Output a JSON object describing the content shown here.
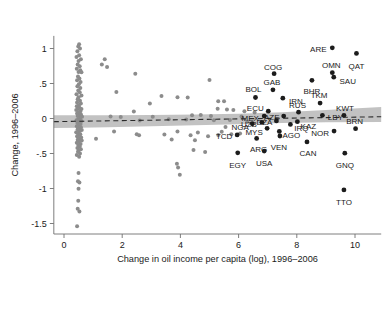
{
  "chart_data": {
    "type": "scatter",
    "title": "",
    "subtitle": "",
    "xlabel": "Change in oil income per capita (log), 1996–2006",
    "ylabel": "Change, 1996–2006",
    "xlim": [
      -0.35,
      10.9
    ],
    "ylim": [
      -1.65,
      1.18
    ],
    "xticks": [
      0,
      2,
      4,
      6,
      8,
      10
    ],
    "xticklabels": [
      "0",
      "2",
      "4",
      "6",
      "8",
      "10"
    ],
    "yticks": [
      1,
      0.5,
      0,
      -0.5,
      -1,
      -1.5
    ],
    "yticklabels": [
      "1",
      ".5",
      "0",
      "-.5",
      "-1",
      "-1.5"
    ],
    "grid": false,
    "legend": null,
    "legend_position": "none",
    "marker_color_background": "#8c8c8c",
    "marker_color_labeled": "#1c1c1c",
    "fit_line_color": "#2a2a2a",
    "fit_line_style": "dashed",
    "ci_band_color": "#bdbdbd",
    "annotations_note": "Labeled points are ISO3 country codes for oil producers",
    "fit_line": {
      "name": "linear fit",
      "x": [
        -0.35,
        10.9
      ],
      "y": [
        -0.045,
        0.025
      ]
    },
    "ci_band": {
      "name": "confidence interval",
      "x": [
        -0.35,
        0.5,
        1.5,
        3.0,
        4.5,
        6.0,
        7.5,
        9.0,
        10.9
      ],
      "y_upper": [
        0.045,
        0.045,
        0.046,
        0.05,
        0.057,
        0.068,
        0.088,
        0.12,
        0.165
      ],
      "y_lower": [
        -0.135,
        -0.132,
        -0.125,
        -0.112,
        -0.098,
        -0.082,
        -0.065,
        -0.055,
        -0.05
      ]
    },
    "series": [
      {
        "name": "Labeled oil producers",
        "marker": "filled-circle-dark",
        "points": [
          {
            "label": "ARE",
            "x": 9.22,
            "y": 1.01,
            "label_dx": -14,
            "label_dy": 1
          },
          {
            "label": "QAT",
            "x": 10.05,
            "y": 0.93,
            "label_dx": 0,
            "label_dy": 13
          },
          {
            "label": "COG",
            "x": 7.22,
            "y": 0.64,
            "label_dx": -1,
            "label_dy": -7
          },
          {
            "label": "OMN",
            "x": 9.22,
            "y": 0.655,
            "label_dx": -1,
            "label_dy": -7
          },
          {
            "label": "SAU",
            "x": 9.27,
            "y": 0.59,
            "label_dx": 14,
            "label_dy": 4
          },
          {
            "label": "BHR",
            "x": 8.52,
            "y": 0.545,
            "label_dx": 0,
            "label_dy": 11
          },
          {
            "label": "GAB",
            "x": 7.18,
            "y": 0.41,
            "label_dx": -1,
            "label_dy": -8
          },
          {
            "label": "BOL",
            "x": 6.58,
            "y": 0.3,
            "label_dx": -2,
            "label_dy": -8
          },
          {
            "label": "IRN",
            "x": 7.52,
            "y": 0.29,
            "label_dx": 13,
            "label_dy": 3
          },
          {
            "label": "TKM",
            "x": 8.8,
            "y": 0.22,
            "label_dx": -1,
            "label_dy": -8
          },
          {
            "label": "ECU",
            "x": 7.02,
            "y": 0.105,
            "label_dx": -13,
            "label_dy": -3
          },
          {
            "label": "RUS",
            "x": 8.06,
            "y": 0.09,
            "label_dx": -1,
            "label_dy": -7
          },
          {
            "label": "LBY",
            "x": 8.88,
            "y": 0.045,
            "label_dx": 13,
            "label_dy": 2
          },
          {
            "label": "KWT",
            "x": 9.62,
            "y": 0.045,
            "label_dx": 1,
            "label_dy": -7
          },
          {
            "label": "MEX",
            "x": 6.88,
            "y": 0.035,
            "label_dx": -14,
            "label_dy": 2
          },
          {
            "label": "AZE",
            "x": 7.55,
            "y": 0.035,
            "label_dx": -12,
            "label_dy": 1
          },
          {
            "label": "DZA",
            "x": 7.3,
            "y": -0.035,
            "label_dx": -12,
            "label_dy": 1
          },
          {
            "label": "KAZ",
            "x": 8.02,
            "y": -0.045,
            "label_dx": 11,
            "label_dy": 5
          },
          {
            "label": "UZB",
            "x": 6.8,
            "y": -0.055,
            "label_dx": -13,
            "label_dy": 2
          },
          {
            "label": "IRQ",
            "x": 7.78,
            "y": -0.085,
            "label_dx": 11,
            "label_dy": 4
          },
          {
            "label": "NGA",
            "x": 6.47,
            "y": -0.075,
            "label_dx": -12,
            "label_dy": 3
          },
          {
            "label": "BRN",
            "x": 10.02,
            "y": -0.145,
            "label_dx": -1,
            "label_dy": -7
          },
          {
            "label": "MYS",
            "x": 6.98,
            "y": -0.14,
            "label_dx": -13,
            "label_dy": 4
          },
          {
            "label": "AGO",
            "x": 7.4,
            "y": -0.185,
            "label_dx": 12,
            "label_dy": 4
          },
          {
            "label": "NOR",
            "x": 9.28,
            "y": -0.18,
            "label_dx": -14,
            "label_dy": 2
          },
          {
            "label": "TCD",
            "x": 5.95,
            "y": -0.235,
            "label_dx": -13,
            "label_dy": 1
          },
          {
            "label": "ARG",
            "x": 6.62,
            "y": -0.285,
            "label_dx": 2,
            "label_dy": 11
          },
          {
            "label": "VEN",
            "x": 7.42,
            "y": -0.25,
            "label_dx": -1,
            "label_dy": 11
          },
          {
            "label": "CAN",
            "x": 8.35,
            "y": -0.335,
            "label_dx": 1,
            "label_dy": 11
          },
          {
            "label": "GNQ",
            "x": 9.65,
            "y": -0.495,
            "label_dx": 0,
            "label_dy": 12
          },
          {
            "label": "EGY",
            "x": 5.97,
            "y": -0.49,
            "label_dx": 0,
            "label_dy": 12
          },
          {
            "label": "USA",
            "x": 6.88,
            "y": -0.465,
            "label_dx": 0,
            "label_dy": 12
          },
          {
            "label": "TTO",
            "x": 9.62,
            "y": -1.02,
            "label_dx": 0,
            "label_dy": 12
          }
        ]
      },
      {
        "name": "Other countries",
        "marker": "filled-circle-grey",
        "points": [
          {
            "x": 0.52,
            "y": 1.06
          },
          {
            "x": 0.49,
            "y": 1.03
          },
          {
            "x": 0.55,
            "y": 1.0
          },
          {
            "x": 0.46,
            "y": 0.96
          },
          {
            "x": 0.52,
            "y": 0.905
          },
          {
            "x": 0.43,
            "y": 0.88
          },
          {
            "x": 0.58,
            "y": 0.845
          },
          {
            "x": 0.5,
            "y": 0.82
          },
          {
            "x": 1.4,
            "y": 0.845
          },
          {
            "x": 1.3,
            "y": 0.77
          },
          {
            "x": 1.48,
            "y": 0.735
          },
          {
            "x": 0.47,
            "y": 0.77
          },
          {
            "x": 0.54,
            "y": 0.745
          },
          {
            "x": 0.44,
            "y": 0.71
          },
          {
            "x": 0.56,
            "y": 0.69
          },
          {
            "x": 0.5,
            "y": 0.665
          },
          {
            "x": 0.6,
            "y": 0.66
          },
          {
            "x": 2.45,
            "y": 0.64
          },
          {
            "x": 0.48,
            "y": 0.6
          },
          {
            "x": 0.53,
            "y": 0.57
          },
          {
            "x": 0.45,
            "y": 0.545
          },
          {
            "x": 0.57,
            "y": 0.52
          },
          {
            "x": 5.0,
            "y": 0.55
          },
          {
            "x": 0.51,
            "y": 0.49
          },
          {
            "x": 0.46,
            "y": 0.46
          },
          {
            "x": 0.56,
            "y": 0.435
          },
          {
            "x": 1.8,
            "y": 0.38
          },
          {
            "x": 0.49,
            "y": 0.4
          },
          {
            "x": 0.54,
            "y": 0.375
          },
          {
            "x": 0.43,
            "y": 0.345
          },
          {
            "x": 0.6,
            "y": 0.33
          },
          {
            "x": 0.5,
            "y": 0.305
          },
          {
            "x": 3.35,
            "y": 0.32
          },
          {
            "x": 3.9,
            "y": 0.305
          },
          {
            "x": 4.25,
            "y": 0.3
          },
          {
            "x": 0.47,
            "y": 0.275
          },
          {
            "x": 0.55,
            "y": 0.255
          },
          {
            "x": 0.45,
            "y": 0.23
          },
          {
            "x": 0.58,
            "y": 0.215
          },
          {
            "x": 0.51,
            "y": 0.19
          },
          {
            "x": 0.44,
            "y": 0.175
          },
          {
            "x": 2.95,
            "y": 0.215
          },
          {
            "x": 5.3,
            "y": 0.245
          },
          {
            "x": 5.5,
            "y": 0.245
          },
          {
            "x": 0.53,
            "y": 0.155
          },
          {
            "x": 0.48,
            "y": 0.14
          },
          {
            "x": 0.6,
            "y": 0.135
          },
          {
            "x": 0.42,
            "y": 0.12
          },
          {
            "x": 0.56,
            "y": 0.105
          },
          {
            "x": 0.5,
            "y": 0.09
          },
          {
            "x": 2.4,
            "y": 0.1
          },
          {
            "x": 5.28,
            "y": 0.14
          },
          {
            "x": 5.6,
            "y": 0.13
          },
          {
            "x": 5.82,
            "y": 0.12
          },
          {
            "x": 6.2,
            "y": 0.105
          },
          {
            "x": 6.55,
            "y": 0.085
          },
          {
            "x": 0.45,
            "y": 0.07
          },
          {
            "x": 0.58,
            "y": 0.06
          },
          {
            "x": 0.52,
            "y": 0.045
          },
          {
            "x": 0.47,
            "y": 0.035
          },
          {
            "x": 0.62,
            "y": 0.025
          },
          {
            "x": 1.6,
            "y": 0.03
          },
          {
            "x": 1.95,
            "y": 0.02
          },
          {
            "x": 3.05,
            "y": 0.025
          },
          {
            "x": 4.4,
            "y": 0.045
          },
          {
            "x": 4.7,
            "y": 0.05
          },
          {
            "x": 5.05,
            "y": 0.035
          },
          {
            "x": 6.1,
            "y": 0.03
          },
          {
            "x": 0.55,
            "y": 0.005
          },
          {
            "x": 0.49,
            "y": -0.01
          },
          {
            "x": 0.43,
            "y": -0.025
          },
          {
            "x": 0.6,
            "y": -0.035
          },
          {
            "x": 0.53,
            "y": -0.05
          },
          {
            "x": 0.46,
            "y": -0.065
          },
          {
            "x": 0.57,
            "y": -0.08
          },
          {
            "x": 2.6,
            "y": -0.03
          },
          {
            "x": 3.6,
            "y": -0.01
          },
          {
            "x": 4.2,
            "y": -0.015
          },
          {
            "x": 5.15,
            "y": -0.025
          },
          {
            "x": 5.7,
            "y": -0.02
          },
          {
            "x": 6.3,
            "y": -0.045
          },
          {
            "x": 0.5,
            "y": -0.095
          },
          {
            "x": 0.44,
            "y": -0.11
          },
          {
            "x": 0.58,
            "y": -0.125
          },
          {
            "x": 0.52,
            "y": -0.14
          },
          {
            "x": 0.47,
            "y": -0.155
          },
          {
            "x": 0.61,
            "y": -0.165
          },
          {
            "x": 0.54,
            "y": -0.18
          },
          {
            "x": 0.42,
            "y": -0.195
          },
          {
            "x": 0.48,
            "y": -0.21
          },
          {
            "x": 3.9,
            "y": -0.185
          },
          {
            "x": 4.6,
            "y": -0.2
          },
          {
            "x": 5.42,
            "y": -0.19
          },
          {
            "x": 5.75,
            "y": -0.225
          },
          {
            "x": 6.05,
            "y": -0.215
          },
          {
            "x": 0.56,
            "y": -0.225
          },
          {
            "x": 0.5,
            "y": -0.24
          },
          {
            "x": 0.45,
            "y": -0.255
          },
          {
            "x": 0.59,
            "y": -0.27
          },
          {
            "x": 0.53,
            "y": -0.285
          },
          {
            "x": 1.1,
            "y": -0.29
          },
          {
            "x": 1.72,
            "y": -0.185
          },
          {
            "x": 2.5,
            "y": -0.225
          },
          {
            "x": 2.58,
            "y": -0.24
          },
          {
            "x": 3.45,
            "y": -0.23
          },
          {
            "x": 4.35,
            "y": -0.24
          },
          {
            "x": 4.95,
            "y": -0.255
          },
          {
            "x": 5.3,
            "y": -0.235
          },
          {
            "x": 0.47,
            "y": -0.305
          },
          {
            "x": 0.61,
            "y": -0.315
          },
          {
            "x": 0.51,
            "y": -0.33
          },
          {
            "x": 0.44,
            "y": -0.345
          },
          {
            "x": 0.57,
            "y": -0.365
          },
          {
            "x": 0.49,
            "y": -0.38
          },
          {
            "x": 3.7,
            "y": -0.3
          },
          {
            "x": 4.5,
            "y": -0.31
          },
          {
            "x": 5.55,
            "y": -0.12
          },
          {
            "x": 0.54,
            "y": -0.4
          },
          {
            "x": 0.46,
            "y": -0.42
          },
          {
            "x": 0.58,
            "y": -0.44
          },
          {
            "x": 0.51,
            "y": -0.455
          },
          {
            "x": 4.45,
            "y": -0.45
          },
          {
            "x": 4.85,
            "y": -0.48
          },
          {
            "x": 0.48,
            "y": -0.475
          },
          {
            "x": 0.55,
            "y": -0.5
          },
          {
            "x": 0.44,
            "y": -0.52
          },
          {
            "x": 0.52,
            "y": -0.545
          },
          {
            "x": 3.88,
            "y": -0.645
          },
          {
            "x": 3.92,
            "y": -0.7
          },
          {
            "x": 0.5,
            "y": -0.78
          },
          {
            "x": 3.98,
            "y": -0.805
          },
          {
            "x": 0.48,
            "y": -0.895
          },
          {
            "x": 0.53,
            "y": -0.915
          },
          {
            "x": 0.5,
            "y": -1.005
          },
          {
            "x": 0.49,
            "y": -1.175
          },
          {
            "x": 0.47,
            "y": -1.29
          },
          {
            "x": 0.53,
            "y": -1.33
          },
          {
            "x": 0.45,
            "y": -1.54
          }
        ]
      }
    ]
  }
}
